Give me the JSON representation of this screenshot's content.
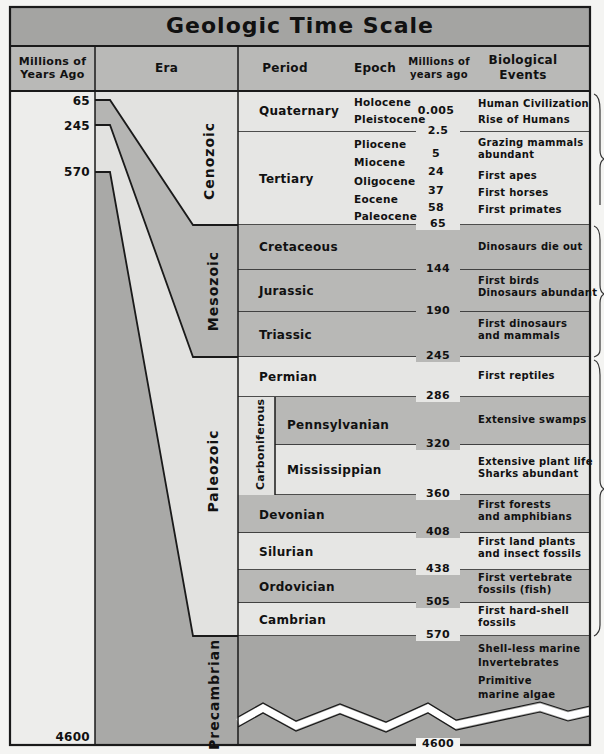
{
  "title": "Geologic Time Scale",
  "headers": {
    "millions_of_years_ago": [
      "Millions of",
      "Years Ago"
    ],
    "era": "Era",
    "period": "Period",
    "epoch": "Epoch",
    "millions_of_years_ago_small": [
      "Millions of",
      "years ago"
    ],
    "biological_events": [
      "Biological",
      "Events"
    ]
  },
  "left_scale": {
    "labels": [
      "65",
      "245",
      "570",
      "4600"
    ]
  },
  "eras": [
    {
      "name": "Cenozoic",
      "start_mya": 0,
      "end_mya": 65
    },
    {
      "name": "Mesozoic",
      "start_mya": 65,
      "end_mya": 245
    },
    {
      "name": "Paleozoic",
      "start_mya": 245,
      "end_mya": 570
    },
    {
      "name": "Precambrian",
      "start_mya": 570,
      "end_mya": 4600
    }
  ],
  "subperiod_group": "Carboniferous",
  "periods": [
    {
      "name": "Quaternary",
      "epochs": [
        "Holocene",
        "Pleistocene"
      ],
      "epoch_numbers": [
        "0.005"
      ],
      "end_label": "2.5",
      "events": [
        "Human Civilization",
        "Rise of Humans"
      ]
    },
    {
      "name": "Tertiary",
      "epochs": [
        "Pliocene",
        "Miocene",
        "Oligocene",
        "Eocene",
        "Paleocene"
      ],
      "epoch_numbers": [
        "5",
        "24",
        "37",
        "58"
      ],
      "end_label": "65",
      "events": [
        "Grazing mammals abundant",
        "First apes",
        "First horses",
        "First primates"
      ]
    },
    {
      "name": "Cretaceous",
      "end_label": "144",
      "events": [
        "Dinosaurs die out"
      ]
    },
    {
      "name": "Jurassic",
      "end_label": "190",
      "events": [
        "First birds",
        "Dinosaurs abundant"
      ]
    },
    {
      "name": "Triassic",
      "end_label": "245",
      "events": [
        "First dinosaurs",
        "and mammals"
      ]
    },
    {
      "name": "Permian",
      "end_label": "286",
      "events": [
        "First reptiles"
      ]
    },
    {
      "name": "Pennsylvanian",
      "end_label": "320",
      "events": [
        "Extensive swamps"
      ]
    },
    {
      "name": "Mississippian",
      "end_label": "360",
      "events": [
        "Extensive plant life",
        "Sharks abundant"
      ]
    },
    {
      "name": "Devonian",
      "end_label": "408",
      "events": [
        "First forests",
        "and amphibians"
      ]
    },
    {
      "name": "Silurian",
      "end_label": "438",
      "events": [
        "First land plants",
        "and insect fossils"
      ]
    },
    {
      "name": "Ordovician",
      "end_label": "505",
      "events": [
        "First vertebrate",
        "fossils (fish)"
      ]
    },
    {
      "name": "Cambrian",
      "end_label": "570",
      "events": [
        "First hard-shell",
        "fossils"
      ]
    },
    {
      "name": "Precambrian",
      "end_label": "4600",
      "events": [
        "Shell-less marine",
        "Invertebrates",
        "Primitive",
        "marine algae"
      ]
    }
  ],
  "colors": {
    "header": "#a9a9a9",
    "light": "#e6e6e4",
    "mid": "#b8b8b6",
    "dark": "#a6a6a4",
    "line": "#1a1a1a",
    "paper": "#f4f4f2"
  }
}
